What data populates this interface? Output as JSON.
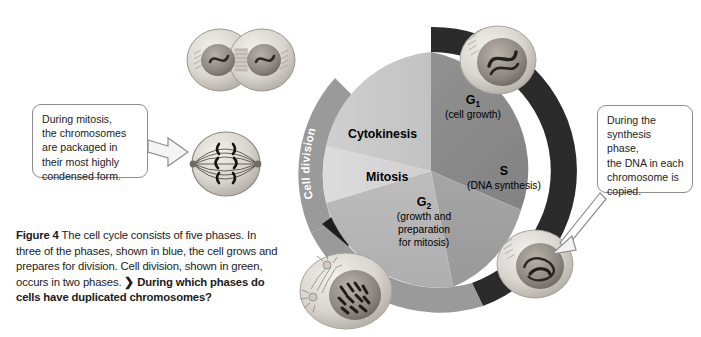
{
  "figure": {
    "label": "Figure 4",
    "caption_line1": "The cell cycle consists of five phases. In",
    "caption_line2": "three of the phases, shown in blue, the cell grows",
    "caption_line3": "and prepares for division. Cell division, shown",
    "caption_line4": "in green, occurs in two phases.",
    "question_marker": "❯",
    "question_line1": "During which",
    "question_line2": "phases do cells have duplicated chromosomes?"
  },
  "callouts": {
    "left": {
      "lines": [
        "During mitosis,",
        "the chromosomes",
        "are packaged in",
        "their most highly",
        "condensed form."
      ]
    },
    "right": {
      "lines": [
        "During the",
        "synthesis phase,",
        "the DNA in each",
        "chromosome is",
        "copied."
      ]
    }
  },
  "cycle": {
    "arcs": [
      {
        "name": "interphase",
        "label": "Interphase",
        "color": "#2b2b2b",
        "text_color": "#ffffff"
      },
      {
        "name": "cell-division",
        "label": "Cell division",
        "color": "#9a9a9a",
        "text_color": "#ffffff"
      }
    ],
    "phases": [
      {
        "id": "g1",
        "name": "G",
        "subscript": "1",
        "detail": [
          "(cell growth)"
        ],
        "group": "interphase",
        "fill": "#8e8e8e"
      },
      {
        "id": "s",
        "name": "S",
        "subscript": "",
        "detail": [
          "(DNA synthesis)"
        ],
        "group": "interphase",
        "fill": "#a0a0a0"
      },
      {
        "id": "g2",
        "name": "G",
        "subscript": "2",
        "detail": [
          "(growth and",
          "preparation",
          "for mitosis)"
        ],
        "group": "interphase",
        "fill": "#b4b4b4"
      },
      {
        "id": "mitosis",
        "name": "Mitosis",
        "subscript": "",
        "detail": [],
        "group": "cell-division",
        "fill": "#d6d6d6"
      },
      {
        "id": "cytokinesis",
        "name": "Cytokinesis",
        "subscript": "",
        "detail": [],
        "group": "cell-division",
        "fill": "#c9c9c9"
      }
    ],
    "micrographs": [
      {
        "id": "cytokinesis-cell",
        "alt": "two daughter cells separating"
      },
      {
        "id": "interphase-cell",
        "alt": "interphase cell with nucleus"
      },
      {
        "id": "s-phase-cell",
        "alt": "cell with duplicating nucleus"
      },
      {
        "id": "g2-cell",
        "alt": "cell with condensed chromosomes"
      },
      {
        "id": "mitosis-cell",
        "alt": "metaphase cell with spindle"
      }
    ]
  },
  "colors": {
    "page_background": "#ffffff",
    "text": "#1b1b1b",
    "callout_border": "#8d8d8d",
    "interphase_arc": "#2b2b2b",
    "celldivision_arc": "#9a9a9a"
  }
}
